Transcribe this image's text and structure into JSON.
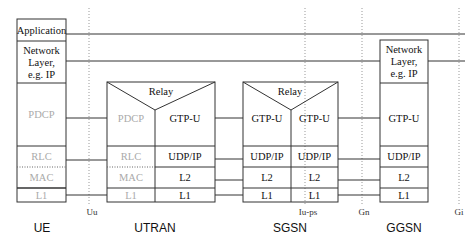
{
  "colors": {
    "line": "#333333",
    "grey_text": "#aaaaaa",
    "text": "#111111",
    "dotted": "#999999"
  },
  "nodes": {
    "ue": {
      "label": "UE",
      "layers": [
        "Application",
        "Network",
        "Layer,",
        "e.g. IP",
        "PDCP",
        "RLC",
        "MAC",
        "L1"
      ]
    },
    "utran": {
      "label": "UTRAN",
      "relay": "Relay",
      "left": [
        "PDCP",
        "RLC",
        "MAC",
        "L1"
      ],
      "right": [
        "GTP-U",
        "UDP/IP",
        "L2",
        "L1"
      ]
    },
    "sgsn": {
      "label": "SGSN",
      "relay": "Relay",
      "left": [
        "GTP-U",
        "UDP/IP",
        "L2",
        "L1"
      ],
      "right": [
        "GTP-U",
        "UDP/IP",
        "L2",
        "L1"
      ]
    },
    "ggsn": {
      "label": "GGSN",
      "layers": [
        "Network",
        "Layer,",
        "e.g. IP",
        "GTP-U",
        "UDP/IP",
        "L2",
        "L1"
      ]
    }
  },
  "interfaces": [
    "Uu",
    "Iu-ps",
    "Gn",
    "Gi"
  ]
}
